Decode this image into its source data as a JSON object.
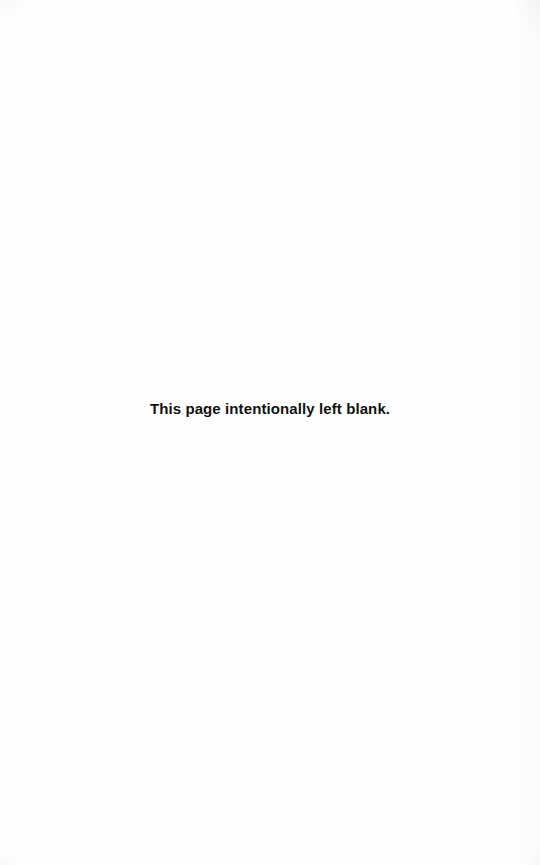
{
  "page": {
    "notice": "This page intentionally left blank."
  },
  "colors": {
    "background": "#fefefe",
    "text": "#111111"
  }
}
